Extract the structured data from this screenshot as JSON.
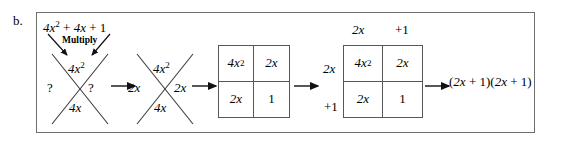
{
  "figure": {
    "part_label": "b.",
    "kind": "algebra-factoring-diagram"
  },
  "step1": {
    "expression": "4x² + 4x + 1",
    "expression_plain": "4x^2 + 4x + 1",
    "operation_label": "Multiply",
    "x_diagram": {
      "top": "4x²",
      "left": "?",
      "right": "?",
      "bottom": "4x"
    }
  },
  "step2": {
    "x_diagram": {
      "top": "4x²",
      "left": "2x",
      "right": "2x",
      "bottom": "4x"
    }
  },
  "step3": {
    "grid": {
      "column_headers": [
        "",
        ""
      ],
      "row_headers": [
        "",
        ""
      ],
      "cells": [
        [
          "4x²",
          "2x"
        ],
        [
          "2x",
          "1"
        ]
      ]
    }
  },
  "step4": {
    "grid": {
      "column_headers": [
        "2x",
        "+1"
      ],
      "row_headers": [
        "2x",
        "+1"
      ],
      "cells": [
        [
          "4x²",
          "2x"
        ],
        [
          "2x",
          "1"
        ]
      ]
    }
  },
  "result": {
    "expression": "(2x + 1)(2x + 1)"
  },
  "colors": {
    "panel_border": "#6f6f6f",
    "grid_border": "#575757",
    "ink": "#000000",
    "background": "#ffffff"
  }
}
